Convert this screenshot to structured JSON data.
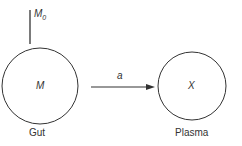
{
  "diagram": {
    "input": {
      "label": "M",
      "subscript": "0"
    },
    "compartments": [
      {
        "id": "gut",
        "symbol": "M",
        "name": "Gut"
      },
      {
        "id": "plasma",
        "symbol": "X",
        "name": "Plasma"
      }
    ],
    "transfer": {
      "rate_label": "a",
      "from": "gut",
      "to": "plasma"
    },
    "colors": {
      "stroke": "#333333",
      "text": "#333333",
      "background": "#ffffff"
    }
  }
}
